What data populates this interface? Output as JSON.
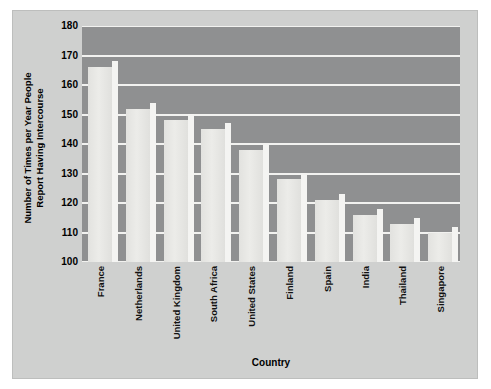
{
  "chart_data": {
    "type": "bar",
    "title": "",
    "subtitle": "",
    "xlabel": "Country",
    "ylabel": "Number of Times per Year People Report Having Intercourse",
    "ylabel_lines": [
      "Number of Times per Year People",
      "Report Having Intercourse"
    ],
    "categories": [
      "France",
      "Netherlands",
      "United Kingdom",
      "South Africa",
      "United States",
      "Finland",
      "Spain",
      "India",
      "Thailand",
      "Singapore"
    ],
    "values": [
      166,
      152,
      148,
      145,
      138,
      128,
      121,
      116,
      113,
      110
    ],
    "ylim": [
      100,
      180
    ],
    "yticks": [
      100,
      110,
      120,
      130,
      140,
      150,
      160,
      170,
      180
    ],
    "ytick_labels": [
      "100",
      "110",
      "120",
      "130",
      "140",
      "150",
      "160",
      "170",
      "180"
    ],
    "grid": true,
    "grid_axis": "y",
    "legend": false,
    "legend_position": "none",
    "series": [
      {
        "name": "Times per year",
        "values": [
          166,
          152,
          148,
          145,
          138,
          128,
          121,
          116,
          113,
          110
        ]
      }
    ]
  },
  "colors": {
    "page_background": "#ffffff",
    "card_background": "#cfd0cf",
    "card_border": "#bdbebd",
    "plot_background": "#8f9091",
    "gridline": "#f2f2f0",
    "bar_face": "#ececea",
    "bar_side": "#f4f4f2",
    "text": "#000000"
  }
}
